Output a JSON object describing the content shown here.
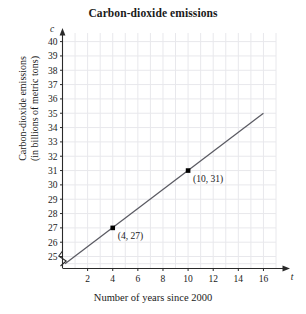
{
  "chart_data": {
    "type": "line",
    "title": "Carbon-dioxide emissions",
    "xlabel": "Number of years since 2000",
    "ylabel_line1": "Carbon-dioxide emissions",
    "ylabel_line2": "(in billions of metric tons)",
    "x_axis_variable": "t",
    "y_axis_variable": "c",
    "xlim": [
      0,
      17
    ],
    "ylim": [
      24.2,
      40.6
    ],
    "xticks": [
      2,
      4,
      6,
      8,
      10,
      12,
      14,
      16
    ],
    "yticks": [
      25,
      26,
      27,
      28,
      29,
      30,
      31,
      32,
      33,
      34,
      35,
      36,
      37,
      38,
      39,
      40
    ],
    "grid": true,
    "y_axis_break": true,
    "legend": "none",
    "series": [
      {
        "name": "Carbon-dioxide emissions trend",
        "line_points": [
          [
            0.2,
            24.5
          ],
          [
            16.0,
            35.0
          ]
        ],
        "slope": 0.6667,
        "intercept": 24.333
      }
    ],
    "points": [
      {
        "x": 4,
        "y": 27,
        "label": "(4, 27)"
      },
      {
        "x": 10,
        "y": 31,
        "label": "(10, 31)"
      }
    ],
    "colors": {
      "line": "#5a5a62",
      "grid": "#e8e8ec",
      "axis": "#2a2a2a",
      "marker": "#000000",
      "background": "#ffffff"
    }
  }
}
